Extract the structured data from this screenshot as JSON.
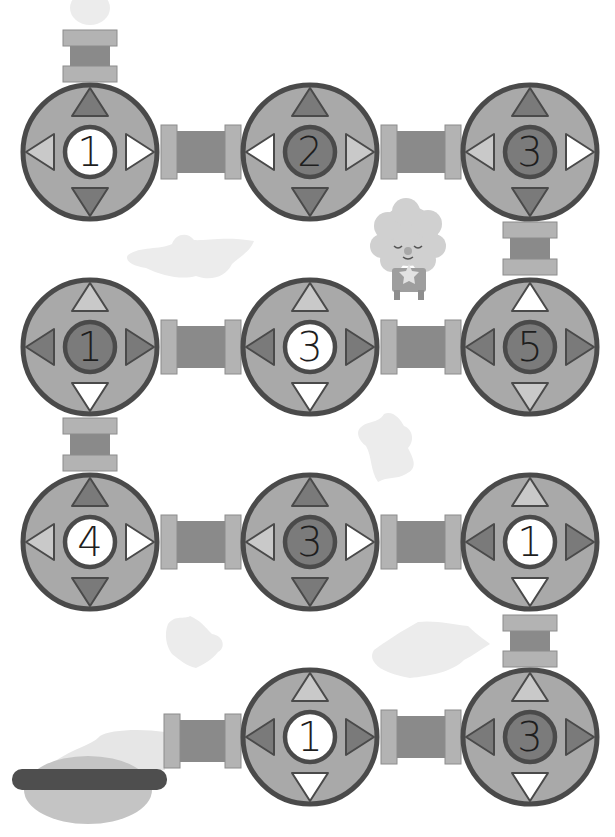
{
  "puzzle": {
    "title": "",
    "colors": {
      "outline": "#4a4a4a",
      "circle_fill": "#a9a9a9",
      "center_dark": "#7b7b7b",
      "center_light": "#ffffff",
      "tri_dark": "#7a7a7a",
      "tri_light": "#c9c9c9",
      "tri_white": "#ffffff",
      "flange": "#b3b3b3",
      "flange_stroke": "#8c8c8c",
      "pipe_body": "#8a8a8a",
      "blob": "#ececec",
      "bucket_bar": "#4e4e4e",
      "bucket_bowl": "#c4c4c4"
    },
    "nodes": [
      {
        "id": "r1c1",
        "cx": 90,
        "cy": 152,
        "number": "1",
        "center": "light",
        "up": "dark",
        "down": "dark",
        "left": "light",
        "right": "white"
      },
      {
        "id": "r1c2",
        "cx": 310,
        "cy": 152,
        "number": "2",
        "center": "dark",
        "up": "dark",
        "down": "dark",
        "left": "white",
        "right": "light"
      },
      {
        "id": "r1c3",
        "cx": 530,
        "cy": 152,
        "number": "3",
        "center": "dark",
        "up": "dark",
        "down": "dark",
        "left": "light",
        "right": "white"
      },
      {
        "id": "r2c1",
        "cx": 90,
        "cy": 347,
        "number": "1",
        "center": "dark",
        "up": "light",
        "down": "white",
        "left": "dark",
        "right": "dark"
      },
      {
        "id": "r2c2",
        "cx": 310,
        "cy": 347,
        "number": "3",
        "center": "light",
        "up": "light",
        "down": "white",
        "left": "dark",
        "right": "dark"
      },
      {
        "id": "r2c3",
        "cx": 530,
        "cy": 347,
        "number": "5",
        "center": "dark",
        "up": "white",
        "down": "light",
        "left": "dark",
        "right": "dark"
      },
      {
        "id": "r3c1",
        "cx": 90,
        "cy": 542,
        "number": "4",
        "center": "light",
        "up": "dark",
        "down": "dark",
        "left": "light",
        "right": "white"
      },
      {
        "id": "r3c2",
        "cx": 310,
        "cy": 542,
        "number": "3",
        "center": "dark",
        "up": "dark",
        "down": "dark",
        "left": "light",
        "right": "white"
      },
      {
        "id": "r3c3",
        "cx": 530,
        "cy": 542,
        "number": "1",
        "center": "light",
        "up": "light",
        "down": "white",
        "left": "dark",
        "right": "dark"
      },
      {
        "id": "r4c2",
        "cx": 310,
        "cy": 737,
        "number": "1",
        "center": "light",
        "up": "light",
        "down": "white",
        "left": "dark",
        "right": "dark"
      },
      {
        "id": "r4c3",
        "cx": 530,
        "cy": 737,
        "number": "3",
        "center": "dark",
        "up": "light",
        "down": "white",
        "left": "dark",
        "right": "dark"
      }
    ],
    "pipes": [
      {
        "id": "pipe-entry-top",
        "orientation": "vertical",
        "x": 90,
        "y1": 30,
        "y2": 82
      },
      {
        "id": "pipe-r1-a",
        "orientation": "horizontal",
        "y": 152,
        "x1": 161,
        "x2": 241
      },
      {
        "id": "pipe-r1-b",
        "orientation": "horizontal",
        "y": 152,
        "x1": 381,
        "x2": 461
      },
      {
        "id": "pipe-r1-r2",
        "orientation": "vertical",
        "x": 530,
        "y1": 222,
        "y2": 275
      },
      {
        "id": "pipe-r2-a",
        "orientation": "horizontal",
        "y": 347,
        "x1": 161,
        "x2": 241
      },
      {
        "id": "pipe-r2-b",
        "orientation": "horizontal",
        "y": 347,
        "x1": 381,
        "x2": 461
      },
      {
        "id": "pipe-r2-r3",
        "orientation": "vertical",
        "x": 90,
        "y1": 418,
        "y2": 471
      },
      {
        "id": "pipe-r3-a",
        "orientation": "horizontal",
        "y": 542,
        "x1": 161,
        "x2": 241
      },
      {
        "id": "pipe-r3-b",
        "orientation": "horizontal",
        "y": 542,
        "x1": 381,
        "x2": 461
      },
      {
        "id": "pipe-r3-r4",
        "orientation": "vertical",
        "x": 530,
        "y1": 615,
        "y2": 667
      },
      {
        "id": "pipe-r4-a",
        "orientation": "horizontal",
        "y": 737,
        "x1": 381,
        "x2": 461
      },
      {
        "id": "pipe-exit",
        "orientation": "horizontal",
        "y": 741,
        "x1": 164,
        "x2": 241
      }
    ],
    "decorations": {
      "character": "fluffy-cloud-sheep",
      "bucket": "bucket",
      "splashes": 5
    }
  }
}
